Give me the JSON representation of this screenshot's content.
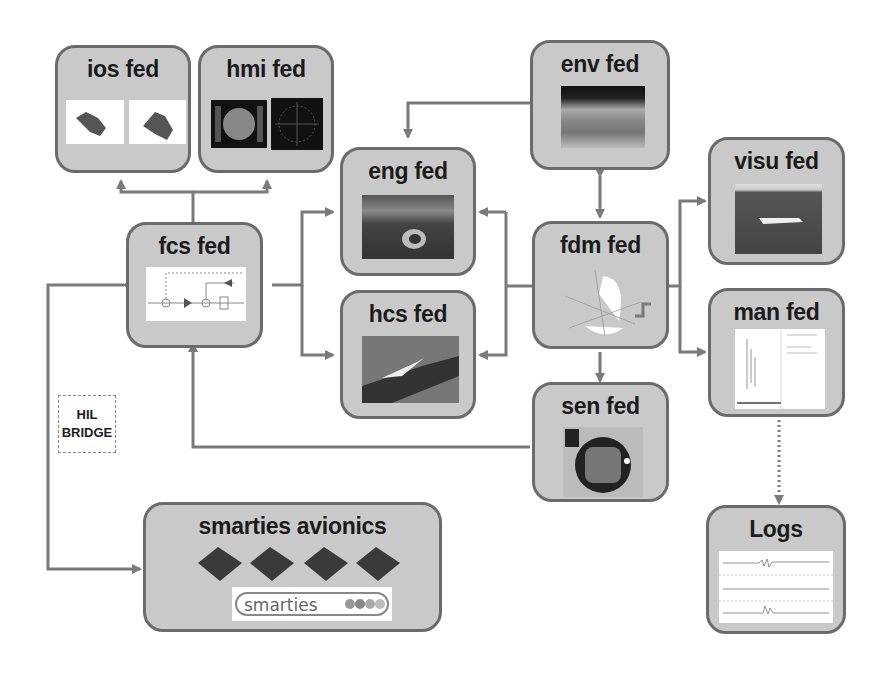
{
  "diagram": {
    "nodes": [
      {
        "id": "ios",
        "label": "ios fed",
        "image": "robot-arm thumbnails (2)"
      },
      {
        "id": "hmi",
        "label": "hmi fed",
        "image": "cockpit display thumbnails (2)"
      },
      {
        "id": "fcs",
        "label": "fcs fed",
        "image": "control block diagram"
      },
      {
        "id": "eng",
        "label": "eng fed",
        "image": "aircraft engine"
      },
      {
        "id": "hcs",
        "label": "hcs fed",
        "image": "aircraft wing"
      },
      {
        "id": "env",
        "label": "env fed",
        "image": "earth atmosphere"
      },
      {
        "id": "fdm",
        "label": "fdm fed",
        "image": "flight dynamics axes sphere"
      },
      {
        "id": "sen",
        "label": "sen fed",
        "image": "sensor chip"
      },
      {
        "id": "visu",
        "label": "visu fed",
        "image": "aircraft 3D view"
      },
      {
        "id": "man",
        "label": "man fed",
        "image": "manager window"
      },
      {
        "id": "logs",
        "label": "Logs",
        "image": "signal traces"
      },
      {
        "id": "smarties",
        "label": "smarties avionics",
        "image": "4 avionics boards",
        "logo": "smarties"
      }
    ],
    "hil_bridge": {
      "line1": "HIL",
      "line2": "BRIDGE"
    },
    "edges": [
      {
        "from": "fcs",
        "to": "ios"
      },
      {
        "from": "fcs",
        "to": "hmi"
      },
      {
        "from": "fcs",
        "to": "eng"
      },
      {
        "from": "fcs",
        "to": "hcs"
      },
      {
        "from": "env",
        "to": "eng"
      },
      {
        "from": "env",
        "to": "fdm",
        "bidirectional": true
      },
      {
        "from": "fdm",
        "to": "eng"
      },
      {
        "from": "fdm",
        "to": "hcs"
      },
      {
        "from": "eng",
        "to": "fdm"
      },
      {
        "from": "fdm",
        "to": "visu"
      },
      {
        "from": "fdm",
        "to": "man"
      },
      {
        "from": "fdm",
        "to": "sen"
      },
      {
        "from": "sen",
        "to": "fcs"
      },
      {
        "from": "fcs",
        "to": "smarties",
        "bidirectional": true,
        "via": "HIL BRIDGE"
      },
      {
        "from": "man",
        "to": "logs",
        "style": "dotted"
      }
    ],
    "colors": {
      "box_fill": "#c9c9c9",
      "box_border": "#6b6b6b",
      "arrow": "#7a7a7a",
      "text": "#1b1b1b"
    }
  }
}
